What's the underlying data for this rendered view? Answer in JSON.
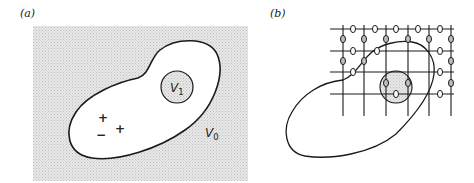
{
  "figure": {
    "panels": [
      {
        "id": "a",
        "label": "(a)",
        "outer_region": {
          "label": "V",
          "subscript": "0"
        },
        "inner_region": {
          "label": "V",
          "subscript": "1"
        },
        "charges": [
          "+",
          "+",
          "−"
        ]
      },
      {
        "id": "b",
        "label": "(b)",
        "grid": {
          "horizontal_lines": 4,
          "vertical_lines": 6
        },
        "element_symbol": "0"
      }
    ]
  },
  "colors": {
    "stipple": "#d9d9d9",
    "stroke": "#1a1a1a",
    "background": "#ffffff",
    "element_fill": "#bdbdbd"
  }
}
